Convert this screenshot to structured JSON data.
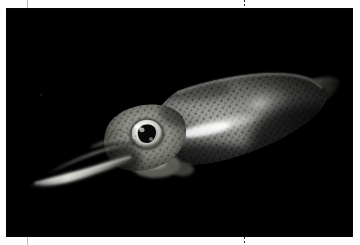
{
  "page": {
    "background_color": "#fefefe",
    "kind": "printed-photograph-page"
  },
  "crop_marks": {
    "line_color": "#b9b9b9",
    "dot_color": "#2a2a2a",
    "items": [
      {
        "name": "top-left-crop-mark",
        "orientation": "vertical",
        "style": "solid"
      },
      {
        "name": "top-center-crop-mark",
        "orientation": "vertical",
        "style": "dotted"
      },
      {
        "name": "bottom-left-crop-mark",
        "orientation": "vertical",
        "style": "solid"
      },
      {
        "name": "bottom-center-crop-mark",
        "orientation": "vertical",
        "style": "dotted"
      }
    ]
  },
  "photo": {
    "subject": "squid",
    "caption": "",
    "alt_text": "A squid photographed against a black background, swimming to the left with tentacles extended, a large bright eye and a mottled speckled mantle with a luminous white streak.",
    "background_color": "#000000",
    "body_highlight_color": "#f2f2f0",
    "body_mid_color": "#7a7a78",
    "body_dark_color": "#1a1a1a",
    "eye_ring_color": "#f6f6f4",
    "pupil_color": "#0b0b0b",
    "orientation": "head-left",
    "features": [
      "tentacles",
      "arms",
      "eye",
      "mantle",
      "chromatophore-speckles",
      "caudal-fin"
    ]
  }
}
